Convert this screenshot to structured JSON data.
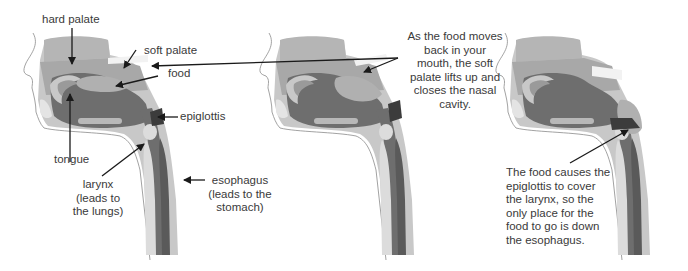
{
  "diagram": {
    "panels": [
      {
        "id": "panel-1",
        "stage": "food in mouth"
      },
      {
        "id": "panel-2",
        "stage": "soft palate lifts"
      },
      {
        "id": "panel-3",
        "stage": "epiglottis covers larynx"
      }
    ],
    "labels": {
      "hard_palate": "hard palate",
      "soft_palate": "soft palate",
      "food": "food",
      "epiglottis": "epiglottis",
      "tongue": "tongue",
      "larynx": [
        "larynx",
        "(leads to",
        "the lungs)"
      ],
      "esophagus": [
        "esophagus",
        "(leads to the",
        "stomach)"
      ]
    },
    "callouts": {
      "soft_palate_note": [
        "As the food moves",
        "back in your",
        "mouth, the soft",
        "palate lifts up and",
        "closes the nasal",
        "cavity."
      ],
      "epiglottis_note": [
        "The food causes the",
        "epiglottis to cover",
        "the larynx, so the",
        "only place for the",
        "food to go is down",
        "the esophagus."
      ]
    },
    "colors": {
      "background": "#ffffff",
      "light_tissue": "#c8c8c8",
      "mid_tissue": "#a9a9a9",
      "dark_cavity": "#6e6e6e",
      "darkest": "#3c3c3c",
      "highlight": "#dcdcdc",
      "text": "#3a3a3a",
      "arrow": "#1a1a1a"
    }
  }
}
